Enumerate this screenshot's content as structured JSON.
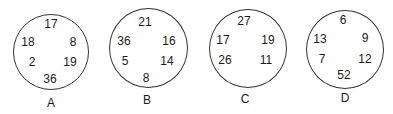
{
  "figures": [
    {
      "label": "A",
      "numbers": {
        "top": "17",
        "upper_left": "18",
        "upper_right": "8",
        "lower_left": "2",
        "lower_right": "19",
        "bottom": "36"
      }
    },
    {
      "label": "B",
      "numbers": {
        "top": "21",
        "upper_left": "36",
        "upper_right": "16",
        "lower_left": "5",
        "lower_right": "14",
        "bottom": "8"
      }
    },
    {
      "label": "C",
      "numbers": {
        "top": "27",
        "upper_left": "17",
        "upper_right": "19",
        "lower_left": "26",
        "lower_right": "11"
      }
    },
    {
      "label": "D",
      "numbers": {
        "top": "6",
        "upper_left": "13",
        "upper_right": "9",
        "lower_left": "7",
        "lower_right": "12",
        "bottom": "52"
      }
    }
  ]
}
